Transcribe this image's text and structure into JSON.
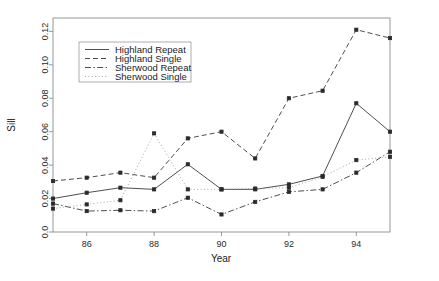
{
  "chart_data": {
    "type": "line",
    "title": "",
    "xlabel": "Year",
    "ylabel": "Sill",
    "xlim": [
      85,
      95
    ],
    "ylim": [
      0.0,
      0.128
    ],
    "grid": false,
    "legend_position": "top-left",
    "x": [
      85,
      86,
      87,
      88,
      89,
      90,
      91,
      92,
      93,
      94,
      95
    ],
    "xticks": [
      86,
      88,
      90,
      92,
      94
    ],
    "xtick_labels": [
      "86",
      "88",
      "90",
      "92",
      "94"
    ],
    "yticks": [
      0.0,
      0.02,
      0.04,
      0.06,
      0.08,
      0.1,
      0.12
    ],
    "ytick_labels": [
      "0.0",
      "0.02",
      "0.04",
      "0.06",
      "0.08",
      "0.10",
      "0.12"
    ],
    "series": [
      {
        "name": "Highland Repeat",
        "style": "solid",
        "color": "#3a3a3a",
        "values": [
          0.02,
          0.0235,
          0.0265,
          0.0255,
          0.0405,
          0.0255,
          0.0255,
          0.0285,
          0.0335,
          0.077,
          0.06
        ]
      },
      {
        "name": "Highland Single",
        "style": "dashed",
        "color": "#3a3a3a",
        "values": [
          0.0305,
          0.0325,
          0.0355,
          0.0325,
          0.056,
          0.06,
          0.044,
          0.08,
          0.0845,
          0.121,
          0.116
        ]
      },
      {
        "name": "Sherwood Repeat",
        "style": "dashdot",
        "color": "#3a3a3a",
        "values": [
          0.017,
          0.0125,
          0.013,
          0.0125,
          0.0205,
          0.0105,
          0.018,
          0.024,
          0.0255,
          0.0355,
          0.048
        ]
      },
      {
        "name": "Sherwood Single",
        "style": "dotted",
        "color": "#9a9a9a",
        "values": [
          0.014,
          0.0165,
          0.019,
          0.059,
          0.0255,
          0.0255,
          0.026,
          0.0265,
          0.033,
          0.043,
          0.045
        ]
      }
    ]
  },
  "legend": {
    "entries": [
      {
        "label": "Highland Repeat"
      },
      {
        "label": "Highland Single"
      },
      {
        "label": "Sherwood Repeat"
      },
      {
        "label": "Sherwood Single"
      }
    ]
  }
}
